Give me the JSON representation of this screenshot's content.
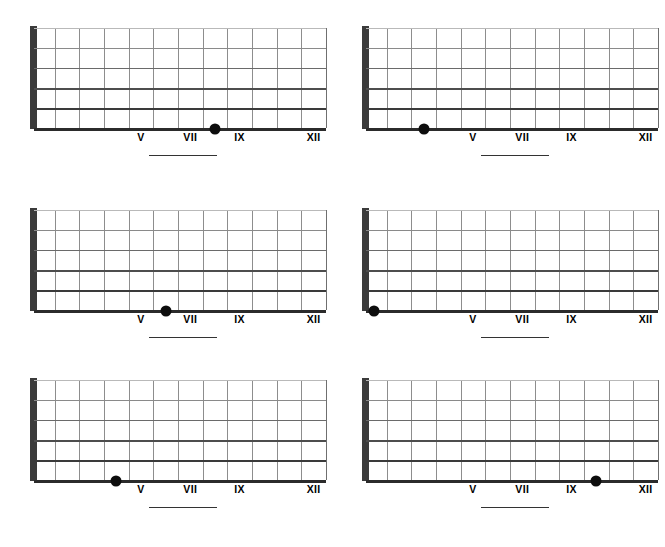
{
  "worksheet": {
    "title": "Guitar Fretboard Note Identification Worksheet",
    "columns": 2,
    "rows": 3,
    "background_color": "#ffffff",
    "ink_color": "#000000"
  },
  "fretboard_common": {
    "string_count": 6,
    "fret_count": 12,
    "nut_label": "nut",
    "marked_string_index": 6,
    "marked_string_name": "low-e-string",
    "fret_marker_labels": [
      "V",
      "VII",
      "IX",
      "XII"
    ],
    "fret_marker_frets": [
      5,
      7,
      9,
      12
    ],
    "dot_color": "#0d0d0d",
    "nut_color": "#3b3b3b",
    "fret_color": "#8d8d8d",
    "string_color": "#2b2b2b"
  },
  "diagrams": [
    {
      "id": "diagram-1",
      "position": "top-left",
      "marked_fret": 8,
      "marked_string": 6,
      "answer_blank": "",
      "fret_markers": [
        {
          "label": "V",
          "fret": 5
        },
        {
          "label": "VII",
          "fret": 7
        },
        {
          "label": "IX",
          "fret": 9
        },
        {
          "label": "XII",
          "fret": 12
        }
      ]
    },
    {
      "id": "diagram-2",
      "position": "top-right",
      "marked_fret": 3,
      "marked_string": 6,
      "answer_blank": "",
      "fret_markers": [
        {
          "label": "V",
          "fret": 5
        },
        {
          "label": "VII",
          "fret": 7
        },
        {
          "label": "IX",
          "fret": 9
        },
        {
          "label": "XII",
          "fret": 12
        }
      ]
    },
    {
      "id": "diagram-3",
      "position": "middle-left",
      "marked_fret": 6,
      "marked_string": 6,
      "answer_blank": "",
      "fret_markers": [
        {
          "label": "V",
          "fret": 5
        },
        {
          "label": "VII",
          "fret": 7
        },
        {
          "label": "IX",
          "fret": 9
        },
        {
          "label": "XII",
          "fret": 12
        }
      ]
    },
    {
      "id": "diagram-4",
      "position": "middle-right",
      "marked_fret": 1,
      "marked_string": 6,
      "answer_blank": "",
      "fret_markers": [
        {
          "label": "V",
          "fret": 5
        },
        {
          "label": "VII",
          "fret": 7
        },
        {
          "label": "IX",
          "fret": 9
        },
        {
          "label": "XII",
          "fret": 12
        }
      ]
    },
    {
      "id": "diagram-5",
      "position": "bottom-left",
      "marked_fret": 4,
      "marked_string": 6,
      "answer_blank": "",
      "fret_markers": [
        {
          "label": "V",
          "fret": 5
        },
        {
          "label": "VII",
          "fret": 7
        },
        {
          "label": "IX",
          "fret": 9
        },
        {
          "label": "XII",
          "fret": 12
        }
      ]
    },
    {
      "id": "diagram-6",
      "position": "bottom-right",
      "marked_fret": 10,
      "marked_string": 6,
      "answer_blank": "",
      "fret_markers": [
        {
          "label": "V",
          "fret": 5
        },
        {
          "label": "VII",
          "fret": 7
        },
        {
          "label": "IX",
          "fret": 9
        },
        {
          "label": "XII",
          "fret": 12
        }
      ]
    }
  ]
}
